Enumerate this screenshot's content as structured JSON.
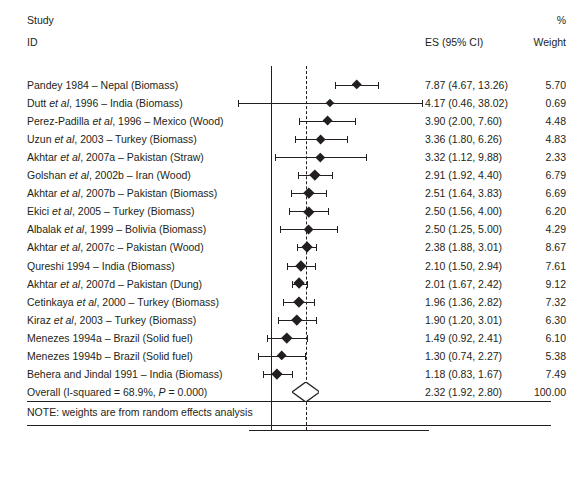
{
  "header": {
    "study_line1": "Study",
    "study_line2": "ID",
    "es_header": "ES (95% CI)",
    "weight_header_top": "%",
    "weight_header_bottom": "Weight"
  },
  "note": "NOTE: weights are from random effects analysis",
  "axis": {
    "title": "Odds ratio (log scale)",
    "scale": "log",
    "ticks": [
      "1",
      "5",
      "10",
      "15",
      "20",
      "40"
    ],
    "tick_values": [
      1,
      5,
      10,
      15,
      20,
      40
    ],
    "null_line_value": 1,
    "summary_line_value": 2.32
  },
  "colors": {
    "ink": "#231f20",
    "background": "#ffffff"
  },
  "chart_data": {
    "type": "forest",
    "title": "",
    "xlabel": "Odds ratio (log scale)",
    "ylabel": "",
    "xscale": "log",
    "xlim": [
      0.4,
      45
    ],
    "grid": false,
    "legend": "none",
    "columns": [
      "Study ID",
      "ES (95% CI)",
      "% Weight"
    ],
    "rows": [
      {
        "label": "Pandey 1984 – Nepal (Biomass)",
        "label_plain": "Pandey 1984 ",
        "es": 7.87,
        "lo": 4.67,
        "hi": 13.26,
        "ci_text": "7.87 (4.67, 13.26)",
        "weight": 5.7,
        "weight_text": "5.70"
      },
      {
        "label": "Dutt et al, 1996 – India (Biomass)",
        "es": 4.17,
        "lo": 0.46,
        "hi": 38.02,
        "ci_text": "4.17 (0.46, 38.02)",
        "weight": 0.69,
        "weight_text": "0.69"
      },
      {
        "label": "Perez-Padilla et al, 1996 – Mexico (Wood)",
        "es": 3.9,
        "lo": 2.0,
        "hi": 7.6,
        "ci_text": "3.90 (2.00, 7.60)",
        "weight": 4.48,
        "weight_text": "4.48"
      },
      {
        "label": "Uzun et al, 2003 – Turkey (Biomass)",
        "es": 3.36,
        "lo": 1.8,
        "hi": 6.26,
        "ci_text": "3.36 (1.80, 6.26)",
        "weight": 4.83,
        "weight_text": "4.83"
      },
      {
        "label": "Akhtar et al, 2007a – Pakistan (Straw)",
        "es": 3.32,
        "lo": 1.12,
        "hi": 9.88,
        "ci_text": "3.32 (1.12, 9.88)",
        "weight": 2.33,
        "weight_text": "2.33"
      },
      {
        "label": "Golshan et al, 2002b – Iran (Wood)",
        "es": 2.91,
        "lo": 1.92,
        "hi": 4.4,
        "ci_text": "2.91 (1.92, 4.40)",
        "weight": 6.79,
        "weight_text": "6.79"
      },
      {
        "label": "Akhtar et al, 2007b – Pakistan (Biomass)",
        "es": 2.51,
        "lo": 1.64,
        "hi": 3.83,
        "ci_text": "2.51 (1.64, 3.83)",
        "weight": 6.69,
        "weight_text": "6.69"
      },
      {
        "label": "Ekici et al, 2005 – Turkey (Biomass)",
        "es": 2.5,
        "lo": 1.56,
        "hi": 4.0,
        "ci_text": "2.50 (1.56, 4.00)",
        "weight": 6.2,
        "weight_text": "6.20"
      },
      {
        "label": "Albalak et al, 1999 – Bolivia (Biomass)",
        "es": 2.5,
        "lo": 1.25,
        "hi": 5.0,
        "ci_text": "2.50 (1.25, 5.00)",
        "weight": 4.29,
        "weight_text": "4.29"
      },
      {
        "label": "Akhtar et al, 2007c – Pakistan (Wood)",
        "es": 2.38,
        "lo": 1.88,
        "hi": 3.01,
        "ci_text": "2.38 (1.88, 3.01)",
        "weight": 8.67,
        "weight_text": "8.67"
      },
      {
        "label": "Qureshi 1994 – India (Biomass)",
        "es": 2.1,
        "lo": 1.5,
        "hi": 2.94,
        "ci_text": "2.10 (1.50, 2.94)",
        "weight": 7.61,
        "weight_text": "7.61"
      },
      {
        "label": "Akhtar et al, 2007d – Pakistan (Dung)",
        "es": 2.01,
        "lo": 1.67,
        "hi": 2.42,
        "ci_text": "2.01 (1.67, 2.42)",
        "weight": 9.12,
        "weight_text": "9.12"
      },
      {
        "label": "Cetinkaya et al, 2000 – Turkey (Biomass)",
        "es": 1.96,
        "lo": 1.36,
        "hi": 2.82,
        "ci_text": "1.96 (1.36, 2.82)",
        "weight": 7.32,
        "weight_text": "7.32"
      },
      {
        "label": "Kiraz et al, 2003 – Turkey (Biomass)",
        "es": 1.9,
        "lo": 1.2,
        "hi": 3.01,
        "ci_text": "1.90 (1.20, 3.01)",
        "weight": 6.3,
        "weight_text": "6.30"
      },
      {
        "label": "Menezes 1994a – Brazil (Solid fuel)",
        "es": 1.49,
        "lo": 0.92,
        "hi": 2.41,
        "ci_text": "1.49 (0.92, 2.41)",
        "weight": 6.1,
        "weight_text": "6.10"
      },
      {
        "label": "Menezes 1994b – Brazil (Solid fuel)",
        "es": 1.3,
        "lo": 0.74,
        "hi": 2.27,
        "ci_text": "1.30 (0.74, 2.27)",
        "weight": 5.38,
        "weight_text": "5.38"
      },
      {
        "label": "Behera and Jindal 1991 – India (Biomass)",
        "es": 1.18,
        "lo": 0.83,
        "hi": 1.67,
        "ci_text": "1.18 (0.83, 1.67)",
        "weight": 7.49,
        "weight_text": "7.49"
      }
    ],
    "overall": {
      "label": "Overall (I-squared = 68.9%, P = 0.000)",
      "es": 2.32,
      "lo": 1.92,
      "hi": 2.8,
      "ci_text": "2.32 (1.92, 2.80)",
      "weight": 100.0,
      "weight_text": "100.00",
      "i_squared": "68.9%",
      "p_value": "0.000"
    }
  },
  "labels_rich": {
    "rows": [
      {
        "pre": "Pandey 1984 – Nepal (Biomass)",
        "it": "",
        "post": ""
      },
      {
        "pre": "Dutt ",
        "it": "et al",
        "post": ", 1996 – India (Biomass)"
      },
      {
        "pre": "Perez-Padilla ",
        "it": "et al",
        "post": ", 1996 – Mexico (Wood)"
      },
      {
        "pre": "Uzun ",
        "it": "et al",
        "post": ", 2003 – Turkey (Biomass)"
      },
      {
        "pre": "Akhtar ",
        "it": "et al",
        "post": ", 2007a – Pakistan (Straw)"
      },
      {
        "pre": "Golshan ",
        "it": "et al",
        "post": ", 2002b – Iran (Wood)"
      },
      {
        "pre": "Akhtar ",
        "it": "et al",
        "post": ", 2007b – Pakistan (Biomass)"
      },
      {
        "pre": "Ekici ",
        "it": "et al",
        "post": ", 2005 – Turkey (Biomass)"
      },
      {
        "pre": "Albalak ",
        "it": "et al",
        "post": ", 1999 – Bolivia (Biomass)"
      },
      {
        "pre": "Akhtar ",
        "it": "et al",
        "post": ", 2007c – Pakistan (Wood)"
      },
      {
        "pre": "Qureshi 1994 – India (Biomass)",
        "it": "",
        "post": ""
      },
      {
        "pre": "Akhtar ",
        "it": "et al",
        "post": ", 2007d – Pakistan (Dung)"
      },
      {
        "pre": "Cetinkaya ",
        "it": "et al",
        "post": ", 2000 – Turkey (Biomass)"
      },
      {
        "pre": "Kiraz ",
        "it": "et al",
        "post": ", 2003 – Turkey (Biomass)"
      },
      {
        "pre": "Menezes 1994a – Brazil (Solid fuel)",
        "it": "",
        "post": ""
      },
      {
        "pre": "Menezes 1994b – Brazil (Solid fuel)",
        "it": "",
        "post": ""
      },
      {
        "pre": "Behera and Jindal 1991 – India (Biomass)",
        "it": "",
        "post": ""
      }
    ],
    "overall": {
      "pre": "Overall (I-squared = 68.9%, ",
      "it": "P",
      "post": " = 0.000)"
    }
  }
}
